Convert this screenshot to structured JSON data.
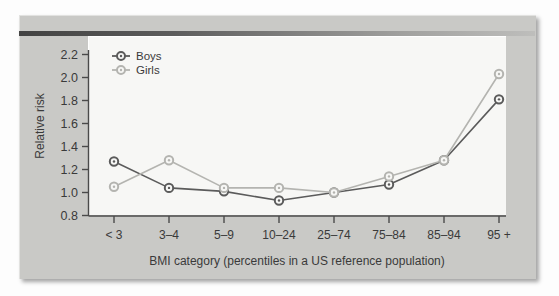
{
  "chart_data": {
    "type": "line",
    "title": "",
    "xlabel": "BMI category (percentiles in a US reference population)",
    "ylabel": "Relative risk",
    "categories": [
      "< 3",
      "3–4",
      "5–9",
      "10–24",
      "25–74",
      "75–84",
      "85–94",
      "95 +"
    ],
    "series": [
      {
        "name": "Boys",
        "values": [
          1.27,
          1.04,
          1.01,
          0.93,
          1.0,
          1.07,
          1.28,
          1.81
        ],
        "color": "#5b5b5b"
      },
      {
        "name": "Girls",
        "values": [
          1.05,
          1.28,
          1.04,
          1.04,
          1.0,
          1.14,
          1.28,
          2.03
        ],
        "color": "#b4b4b0"
      }
    ],
    "ylim": [
      0.8,
      2.3
    ],
    "yticks": [
      0.8,
      1.0,
      1.2,
      1.4,
      1.6,
      1.8,
      2.0,
      2.2
    ],
    "ytick_labels": [
      "0.8",
      "1.0",
      "1.2",
      "1.4",
      "1.6",
      "1.8",
      "2.0",
      "2.2"
    ],
    "grid": false,
    "legend_position": "top-left"
  },
  "axes": {
    "y_title": "Relative risk",
    "x_title": "BMI category (percentiles in a US reference population)"
  },
  "legend": {
    "entries": [
      {
        "label": "Boys"
      },
      {
        "label": "Girls"
      }
    ]
  },
  "colors": {
    "boys": "#5b5b5b",
    "girls": "#b4b4b0",
    "panel": "#c9c9c6",
    "plot_background": "#f7f7f5",
    "axis": "#4a4a4a",
    "text": "#3a3a3a"
  }
}
